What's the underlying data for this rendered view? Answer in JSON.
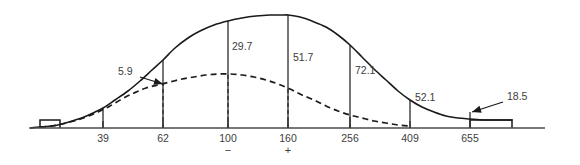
{
  "chart_data": {
    "type": "line",
    "title": "",
    "subtitle": "",
    "xlabel": "",
    "ylabel": "",
    "grid": false,
    "legend_position": "none",
    "axis": {
      "baseline_y_px": 128,
      "x_start_px": 30,
      "x_end_px": 545,
      "xlim_px": [
        30,
        545
      ]
    },
    "categories": [
      "39",
      "62",
      "100",
      "160",
      "256",
      "409",
      "655"
    ],
    "tick_labels": [
      {
        "label": "39",
        "x_px": 103,
        "sign": ""
      },
      {
        "label": "62",
        "x_px": 163,
        "sign": ""
      },
      {
        "label": "100",
        "x_px": 228,
        "sign": "−"
      },
      {
        "label": "160",
        "x_px": 288,
        "sign": "+"
      },
      {
        "label": "256",
        "x_px": 350,
        "sign": ""
      },
      {
        "label": "409",
        "x_px": 410,
        "sign": ""
      },
      {
        "label": "655",
        "x_px": 470,
        "sign": ""
      }
    ],
    "value_labels": [
      {
        "value": "5.9",
        "x_px": 118,
        "y_px": 75,
        "callout": true,
        "anchor_x_px": 163,
        "anchor_y_px": 84
      },
      {
        "value": "29.7",
        "x_px": 232,
        "y_px": 50,
        "callout": false,
        "anchor_x_px": 228,
        "anchor_y_px": 50
      },
      {
        "value": "51.7",
        "x_px": 293,
        "y_px": 61,
        "callout": false,
        "anchor_x_px": 288,
        "anchor_y_px": 61
      },
      {
        "value": "72.1",
        "x_px": 355,
        "y_px": 74,
        "callout": false,
        "anchor_x_px": 350,
        "anchor_y_px": 74
      },
      {
        "value": "52.1",
        "x_px": 415,
        "y_px": 101,
        "callout": false,
        "anchor_x_px": 410,
        "anchor_y_px": 101
      },
      {
        "value": "18.5",
        "x_px": 507,
        "y_px": 100,
        "callout": true,
        "anchor_x_px": 472,
        "anchor_y_px": 112
      }
    ],
    "series": [
      {
        "name": "solid-curve",
        "style": "solid",
        "points_px": [
          [
            30,
            128
          ],
          [
            40,
            127
          ],
          [
            52,
            126
          ],
          [
            62,
            124
          ],
          [
            72,
            121
          ],
          [
            84,
            117
          ],
          [
            95,
            112
          ],
          [
            103,
            108
          ],
          [
            115,
            100
          ],
          [
            128,
            91
          ],
          [
            140,
            81
          ],
          [
            152,
            70
          ],
          [
            163,
            60
          ],
          [
            175,
            48
          ],
          [
            188,
            38
          ],
          [
            200,
            31
          ],
          [
            214,
            25
          ],
          [
            228,
            21
          ],
          [
            242,
            18
          ],
          [
            256,
            16
          ],
          [
            270,
            15
          ],
          [
            284,
            15
          ],
          [
            288,
            15
          ],
          [
            300,
            17
          ],
          [
            312,
            21
          ],
          [
            326,
            27
          ],
          [
            338,
            35
          ],
          [
            350,
            45
          ],
          [
            362,
            57
          ],
          [
            374,
            69
          ],
          [
            386,
            80
          ],
          [
            398,
            91
          ],
          [
            410,
            100
          ],
          [
            422,
            107
          ],
          [
            434,
            112
          ],
          [
            446,
            116
          ],
          [
            458,
            118
          ],
          [
            470,
            119
          ],
          [
            484,
            120
          ],
          [
            498,
            120
          ],
          [
            512,
            120
          ]
        ]
      },
      {
        "name": "dashed-curve",
        "style": "dashed",
        "points_px": [
          [
            40,
            127
          ],
          [
            52,
            126
          ],
          [
            62,
            124
          ],
          [
            74,
            121
          ],
          [
            86,
            117
          ],
          [
            98,
            112
          ],
          [
            110,
            106
          ],
          [
            122,
            99
          ],
          [
            134,
            93
          ],
          [
            146,
            88
          ],
          [
            158,
            85
          ],
          [
            170,
            82
          ],
          [
            182,
            79
          ],
          [
            194,
            77
          ],
          [
            206,
            75
          ],
          [
            218,
            74
          ],
          [
            230,
            74
          ],
          [
            242,
            75
          ],
          [
            254,
            77
          ],
          [
            266,
            80
          ],
          [
            278,
            84
          ],
          [
            290,
            89
          ],
          [
            302,
            95
          ],
          [
            314,
            100
          ],
          [
            326,
            106
          ],
          [
            338,
            111
          ],
          [
            350,
            115
          ],
          [
            362,
            118
          ],
          [
            374,
            121
          ],
          [
            386,
            123
          ],
          [
            398,
            125
          ],
          [
            410,
            126
          ]
        ]
      }
    ],
    "dividers_px": [
      {
        "x": 103,
        "y_top": 108,
        "style": "solid"
      },
      {
        "x": 163,
        "y_top": 60,
        "style": "solid"
      },
      {
        "x": 163,
        "y_top": 84,
        "style": "dashed"
      },
      {
        "x": 228,
        "y_top": 21,
        "style": "solid"
      },
      {
        "x": 228,
        "y_top": 74,
        "style": "dashed"
      },
      {
        "x": 288,
        "y_top": 15,
        "style": "solid"
      },
      {
        "x": 288,
        "y_top": 88,
        "style": "dashed"
      },
      {
        "x": 350,
        "y_top": 45,
        "style": "solid"
      },
      {
        "x": 350,
        "y_top": 115,
        "style": "dashed"
      },
      {
        "x": 410,
        "y_top": 100,
        "style": "solid"
      },
      {
        "x": 470,
        "y_top": 112,
        "style": "solid"
      }
    ],
    "tail_steps_px": [
      {
        "x_left": 40,
        "x_right": 60,
        "y_top": 120
      },
      {
        "x_left": 470,
        "x_right": 512,
        "y_top": 120
      }
    ]
  }
}
